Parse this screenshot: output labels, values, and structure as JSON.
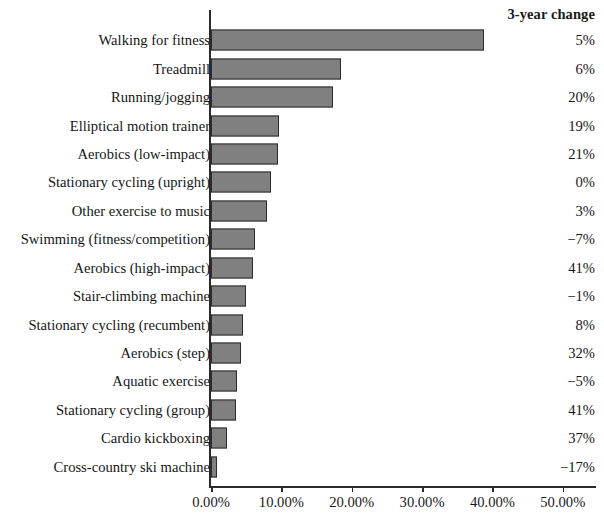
{
  "header": {
    "change_column_title": "3-year change"
  },
  "chart_data": {
    "type": "bar",
    "orientation": "horizontal",
    "title": "",
    "subtitle": "",
    "xlabel": "",
    "ylabel": "",
    "xlim": [
      0,
      55
    ],
    "grid": false,
    "legend": null,
    "bar_color": "#808080",
    "bar_border_color": "#2b2b2b",
    "categories": [
      "Walking for fitness",
      "Treadmill",
      "Running/jogging",
      "Elliptical motion trainer",
      "Aerobics (low-impact)",
      "Stationary cycling (upright)",
      "Other exercise to music",
      "Swimming (fitness/competition)",
      "Aerobics (high-impact)",
      "Stair-climbing machine",
      "Stationary cycling (recumbent)",
      "Aerobics (step)",
      "Aquatic exercise",
      "Stationary cycling (group)",
      "Cardio kickboxing",
      "Cross-country ski machine"
    ],
    "values": [
      38.8,
      18.5,
      17.3,
      9.6,
      9.5,
      8.5,
      8.0,
      6.2,
      6.0,
      5.0,
      4.6,
      4.3,
      3.7,
      3.6,
      2.3,
      0.9
    ],
    "value_unit": "%",
    "tick_values": [
      0,
      10,
      20,
      30,
      40,
      50
    ],
    "tick_labels": [
      "0.00%",
      "10.00%",
      "20.00%",
      "30.00%",
      "40.00%",
      "50.00%"
    ],
    "change_series": {
      "name": "3-year change",
      "values": [
        "5%",
        "6%",
        "20%",
        "19%",
        "21%",
        "0%",
        "3%",
        "−7%",
        "41%",
        "−1%",
        "8%",
        "32%",
        "−5%",
        "41%",
        "37%",
        "−17%"
      ]
    }
  }
}
